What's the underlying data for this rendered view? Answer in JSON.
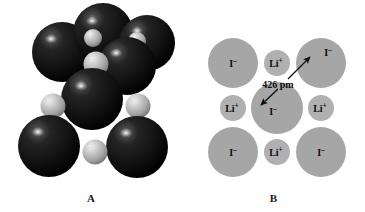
{
  "figure": {
    "type": "crystal-structure-illustration",
    "background_color": "#ffffff",
    "panels": [
      {
        "id": "A",
        "caption": "A",
        "description": "space-filling model of lithium iodide unit cell",
        "ion_colors": {
          "iodide": "#181818",
          "iodide_shadow": "#000000",
          "iodide_highlight": "#d8d8d8",
          "lithium": "#b9b9b9",
          "lithium_highlight": "#f0f0f0",
          "lithium_shadow": "#6d6d6d"
        },
        "spheres": [
          {
            "name": "iodide",
            "cx": 62,
            "cy": 52,
            "r": 30
          },
          {
            "name": "iodide",
            "cx": 103,
            "cy": 33,
            "r": 30
          },
          {
            "name": "iodide",
            "cx": 145,
            "cy": 45,
            "r": 28
          },
          {
            "name": "lithium",
            "cx": 95,
            "cy": 39,
            "r": 9
          },
          {
            "name": "lithium",
            "cx": 136,
            "cy": 42,
            "r": 9
          },
          {
            "name": "iodide",
            "cx": 125,
            "cy": 66,
            "r": 29
          },
          {
            "name": "lithium",
            "cx": 95,
            "cy": 64,
            "r": 12
          },
          {
            "name": "iodide",
            "cx": 92,
            "cy": 97,
            "r": 30
          },
          {
            "name": "lithium",
            "cx": 54,
            "cy": 105,
            "r": 12
          },
          {
            "name": "lithium",
            "cx": 137,
            "cy": 105,
            "r": 12
          },
          {
            "name": "iodide",
            "cx": 50,
            "cy": 145,
            "r": 31
          },
          {
            "name": "iodide",
            "cx": 136,
            "cy": 146,
            "r": 31
          },
          {
            "name": "lithium",
            "cx": 95,
            "cy": 151,
            "r": 12
          }
        ]
      },
      {
        "id": "B",
        "caption": "B",
        "description": "two-dimensional cross-section of lithium iodide lattice",
        "ion_colors": {
          "iodide": "#a6a6a6",
          "lithium": "#b0b0b0",
          "label": "#0d0d0d",
          "arrow": "#0d0d0d"
        },
        "ions": [
          {
            "name": "iodide-top-left",
            "label_base": "I",
            "label_charge": "–",
            "cx": 51,
            "cy": 63,
            "r": 25,
            "species": "iodide"
          },
          {
            "name": "lithium-top-center",
            "label_base": "Li",
            "label_charge": "+",
            "cx": 95,
            "cy": 63,
            "r": 13,
            "species": "lithium"
          },
          {
            "name": "iodide-top-right",
            "label_base": "I",
            "label_charge": "–",
            "cx": 139,
            "cy": 63,
            "r": 25,
            "species": "iodide"
          },
          {
            "name": "lithium-middle-left",
            "label_base": "Li",
            "label_charge": "+",
            "cx": 51,
            "cy": 108,
            "r": 13,
            "species": "lithium"
          },
          {
            "name": "iodide-center",
            "label_base": "I",
            "label_charge": "–",
            "cx": 95,
            "cy": 108,
            "r": 26,
            "species": "iodide"
          },
          {
            "name": "lithium-middle-right",
            "label_base": "Li",
            "label_charge": "+",
            "cx": 139,
            "cy": 108,
            "r": 13,
            "species": "lithium"
          },
          {
            "name": "iodide-bottom-left",
            "label_base": "I",
            "label_charge": "–",
            "cx": 51,
            "cy": 152,
            "r": 25,
            "species": "iodide"
          },
          {
            "name": "lithium-bottom-center",
            "label_base": "Li",
            "label_charge": "+",
            "cx": 95,
            "cy": 152,
            "r": 13,
            "species": "lithium"
          },
          {
            "name": "iodide-bottom-right",
            "label_base": "I",
            "label_charge": "–",
            "cx": 139,
            "cy": 152,
            "r": 25,
            "species": "iodide"
          }
        ],
        "annotation": {
          "name": "iodide-iodide-distance",
          "text": "426 pm",
          "value": 426,
          "unit": "pm",
          "text_x": 96,
          "text_y": 86,
          "arrow_up": {
            "x1": 104,
            "y1": 79,
            "x2": 126,
            "y2": 58
          },
          "arrow_down": {
            "x1": 96,
            "y1": 88,
            "x2": 78,
            "y2": 104
          }
        }
      }
    ]
  }
}
